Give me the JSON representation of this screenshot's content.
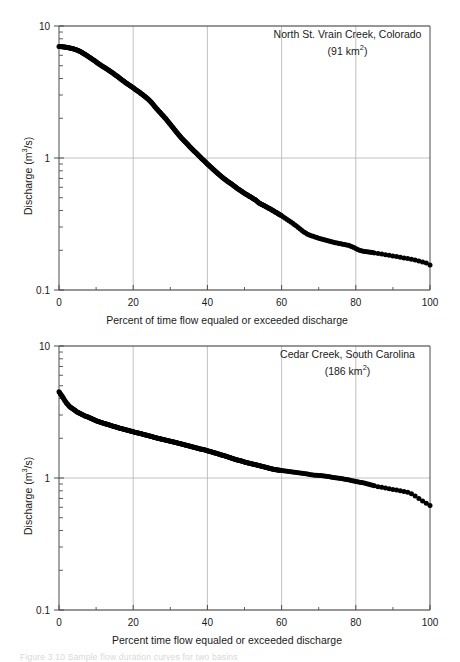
{
  "figure": {
    "background": "#ffffff",
    "marker_color": "#000000",
    "axis_color": "#4d4d4d",
    "grid_color": "#b3b3b3",
    "caption_partial": "Figure 3.10  Sample flow duration curves for two basins"
  },
  "chart_data": [
    {
      "id": "north-st-vrain",
      "type": "scatter",
      "title": "North St. Vrain Creek, Colorado",
      "annotation_line1": "North St. Vrain Creek, Colorado",
      "annotation_line2_prefix": "(91 km",
      "annotation_line2_sup": "2",
      "annotation_line2_suffix": ")",
      "area_km2": 91,
      "region": "Colorado",
      "xlabel": "Percent of time flow equaled or exceeded discharge",
      "ylabel_prefix": "Discharge (m",
      "ylabel_sup": "3",
      "ylabel_suffix": "/s)",
      "xlim": [
        0,
        100
      ],
      "ylim": [
        0.1,
        10
      ],
      "yscale": "log",
      "xticks": [
        0,
        20,
        40,
        60,
        80,
        100
      ],
      "xticklabels": [
        "0",
        "20",
        "40",
        "60",
        "80",
        "100"
      ],
      "yticks": [
        0.1,
        1,
        10
      ],
      "yticklabels": [
        "0.1",
        "1",
        "10"
      ],
      "grid": true,
      "legend": "none",
      "x": [
        0,
        1,
        2,
        3,
        4,
        5,
        6,
        7,
        8,
        9,
        10,
        11,
        12,
        13,
        14,
        15,
        16,
        17,
        18,
        19,
        20,
        21,
        22,
        23,
        24,
        25,
        26,
        27,
        28,
        29,
        30,
        31,
        32,
        33,
        34,
        35,
        36,
        37,
        38,
        39,
        40,
        41,
        42,
        43,
        44,
        45,
        46,
        47,
        48,
        49,
        50,
        51,
        52,
        53,
        54,
        55,
        56,
        57,
        58,
        59,
        60,
        61,
        62,
        63,
        64,
        65,
        66,
        67,
        68,
        69,
        70,
        71,
        72,
        73,
        74,
        75,
        76,
        77,
        78,
        79,
        80,
        81,
        82,
        83,
        84,
        85,
        86,
        87,
        88,
        89,
        90,
        91,
        92,
        93,
        94,
        95,
        96,
        97,
        98,
        99,
        100
      ],
      "y": [
        7.0,
        6.95,
        6.9,
        6.8,
        6.7,
        6.55,
        6.35,
        6.1,
        5.85,
        5.6,
        5.35,
        5.1,
        4.9,
        4.7,
        4.5,
        4.3,
        4.1,
        3.9,
        3.72,
        3.55,
        3.4,
        3.25,
        3.1,
        2.95,
        2.8,
        2.62,
        2.42,
        2.25,
        2.1,
        1.95,
        1.8,
        1.66,
        1.53,
        1.42,
        1.33,
        1.24,
        1.16,
        1.09,
        1.02,
        0.96,
        0.9,
        0.85,
        0.8,
        0.755,
        0.715,
        0.68,
        0.65,
        0.62,
        0.59,
        0.565,
        0.54,
        0.52,
        0.5,
        0.48,
        0.455,
        0.44,
        0.425,
        0.41,
        0.395,
        0.38,
        0.365,
        0.35,
        0.335,
        0.32,
        0.305,
        0.29,
        0.275,
        0.265,
        0.258,
        0.252,
        0.247,
        0.242,
        0.238,
        0.234,
        0.23,
        0.227,
        0.224,
        0.221,
        0.218,
        0.213,
        0.206,
        0.2,
        0.197,
        0.195,
        0.193,
        0.191,
        0.189,
        0.187,
        0.185,
        0.183,
        0.181,
        0.179,
        0.177,
        0.175,
        0.173,
        0.171,
        0.169,
        0.166,
        0.163,
        0.16,
        0.155
      ]
    },
    {
      "id": "cedar-creek",
      "type": "scatter",
      "title": "Cedar Creek, South Carolina",
      "annotation_line1": "Cedar Creek, South Carolina",
      "annotation_line2_prefix": "(186 km",
      "annotation_line2_sup": "2",
      "annotation_line2_suffix": ")",
      "area_km2": 186,
      "region": "South Carolina",
      "xlabel": "Percent time flow equaled or exceeded discharge",
      "ylabel_prefix": "Discharge (m",
      "ylabel_sup": "3",
      "ylabel_suffix": "/s)",
      "xlim": [
        0,
        100
      ],
      "ylim": [
        0.1,
        10
      ],
      "yscale": "log",
      "xticks": [
        0,
        20,
        40,
        60,
        80,
        100
      ],
      "xticklabels": [
        "0",
        "20",
        "40",
        "60",
        "80",
        "100"
      ],
      "yticks": [
        0.1,
        1,
        10
      ],
      "yticklabels": [
        "0.1",
        "1",
        "10"
      ],
      "grid": true,
      "legend": "none",
      "x": [
        0,
        1,
        2,
        3,
        4,
        5,
        6,
        7,
        8,
        9,
        10,
        11,
        12,
        13,
        14,
        15,
        16,
        17,
        18,
        19,
        20,
        21,
        22,
        23,
        24,
        25,
        26,
        27,
        28,
        29,
        30,
        31,
        32,
        33,
        34,
        35,
        36,
        37,
        38,
        39,
        40,
        41,
        42,
        43,
        44,
        45,
        46,
        47,
        48,
        49,
        50,
        51,
        52,
        53,
        54,
        55,
        56,
        57,
        58,
        59,
        60,
        61,
        62,
        63,
        64,
        65,
        66,
        67,
        68,
        69,
        70,
        71,
        72,
        73,
        74,
        75,
        76,
        77,
        78,
        79,
        80,
        81,
        82,
        83,
        84,
        85,
        86,
        87,
        88,
        89,
        90,
        91,
        92,
        93,
        94,
        95,
        96,
        97,
        98,
        99,
        100
      ],
      "y": [
        4.5,
        4.1,
        3.7,
        3.45,
        3.3,
        3.15,
        3.05,
        2.95,
        2.88,
        2.8,
        2.72,
        2.66,
        2.6,
        2.55,
        2.5,
        2.45,
        2.4,
        2.36,
        2.32,
        2.28,
        2.24,
        2.2,
        2.17,
        2.13,
        2.1,
        2.06,
        2.02,
        1.99,
        1.96,
        1.93,
        1.9,
        1.87,
        1.84,
        1.81,
        1.78,
        1.75,
        1.72,
        1.69,
        1.66,
        1.64,
        1.61,
        1.58,
        1.55,
        1.52,
        1.49,
        1.46,
        1.43,
        1.4,
        1.37,
        1.35,
        1.32,
        1.3,
        1.28,
        1.26,
        1.24,
        1.22,
        1.2,
        1.18,
        1.16,
        1.15,
        1.14,
        1.13,
        1.12,
        1.11,
        1.1,
        1.09,
        1.08,
        1.07,
        1.06,
        1.05,
        1.045,
        1.04,
        1.03,
        1.02,
        1.01,
        1.0,
        0.99,
        0.98,
        0.97,
        0.955,
        0.94,
        0.93,
        0.92,
        0.905,
        0.89,
        0.875,
        0.86,
        0.85,
        0.84,
        0.83,
        0.82,
        0.81,
        0.8,
        0.79,
        0.78,
        0.76,
        0.73,
        0.7,
        0.67,
        0.645,
        0.62
      ]
    }
  ]
}
